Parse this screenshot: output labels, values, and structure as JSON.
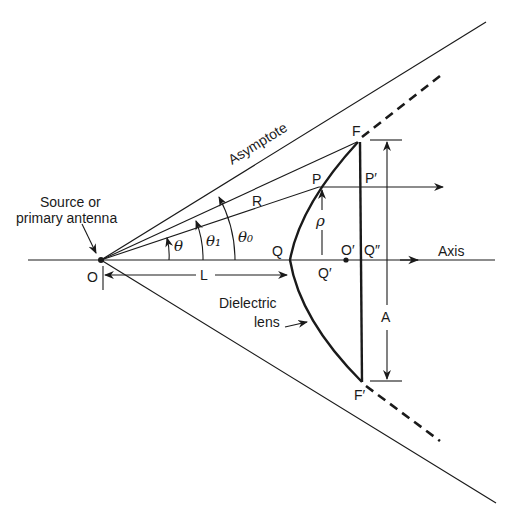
{
  "diagram": {
    "labels": {
      "source": "Source or",
      "source2": "primary antenna",
      "asymptote": "Asymptote",
      "axis": "Axis",
      "lens1": "Dielectric",
      "lens2": "lens",
      "O": "O",
      "L": "L",
      "R": "R",
      "P": "P",
      "P_prime": "P′",
      "Q": "Q",
      "Q_prime": "Q′",
      "O_prime": "O′",
      "Q_dprime": "Q″",
      "F": "F",
      "F_prime": "F′",
      "A": "A",
      "rho": "ρ",
      "theta": "θ",
      "theta1": "θ₁",
      "theta0": "θ₀"
    },
    "colors": {
      "ink": "#1a1a1a",
      "background": "#ffffff"
    }
  }
}
